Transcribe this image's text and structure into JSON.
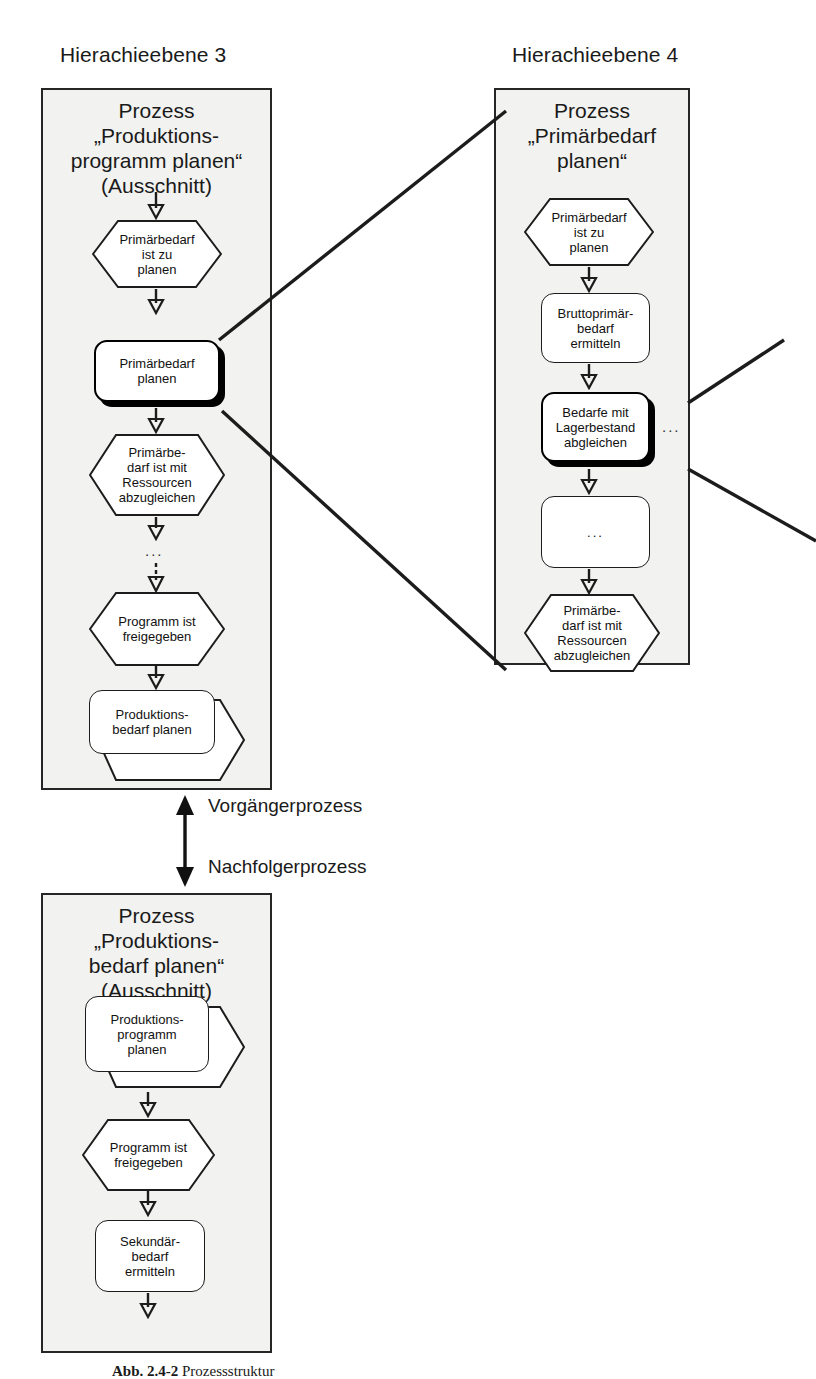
{
  "figure": {
    "caption_label": "Abb. 2.4-2",
    "caption_text": "Prozessstruktur"
  },
  "levels": [
    {
      "id": "level3",
      "label": "Hierachieebene 3"
    },
    {
      "id": "level4",
      "label": "Hierachieebene 4"
    }
  ],
  "boxes": {
    "left": {
      "title": "Prozess\n„Produktions-\nprogramm planen“\n(Ausschnitt)",
      "nodes": [
        {
          "id": "l-ev1",
          "type": "event",
          "text": "Primärbedarf\nist zu\nplanen"
        },
        {
          "id": "l-fn1",
          "type": "function",
          "text": "Primärbedarf\nplanen",
          "highlighted": true
        },
        {
          "id": "l-ev2",
          "type": "event",
          "text": "Primärbe-\ndarf ist mit\nRessourcen\nabzugleichen"
        },
        {
          "id": "l-gap",
          "type": "ellipsis",
          "text": "..."
        },
        {
          "id": "l-ev3",
          "type": "event",
          "text": "Programm ist\nfreigegeben"
        },
        {
          "id": "l-if1",
          "type": "interface",
          "text": "Produktions-\nbedarf planen"
        }
      ]
    },
    "right": {
      "title": "Prozess\n„Primärbedarf\nplanen“",
      "nodes": [
        {
          "id": "r-ev1",
          "type": "event",
          "text": "Primärbedarf\nist zu\nplanen"
        },
        {
          "id": "r-fn1",
          "type": "function",
          "text": "Bruttoprimär-\nbedarf\nermitteln"
        },
        {
          "id": "r-fn2",
          "type": "function",
          "text": "Bedarfe mit\nLagerbestand\nabgleichen",
          "highlighted": true
        },
        {
          "id": "r-fn3",
          "type": "function",
          "text": "..."
        },
        {
          "id": "r-ev2",
          "type": "event",
          "text": "Primärbe-\ndarf ist mit\nRessourcen\nabzugleichen"
        }
      ],
      "side_ellipsis": "..."
    },
    "bottom": {
      "title": "Prozess\n„Produktions-\nbedarf planen“\n(Ausschnitt)",
      "nodes": [
        {
          "id": "b-if1",
          "type": "interface",
          "text": "Produktions-\nprogramm\nplanen"
        },
        {
          "id": "b-ev1",
          "type": "event",
          "text": "Programm ist\nfreigegeben"
        },
        {
          "id": "b-fn1",
          "type": "function",
          "text": "Sekundär-\nbedarf\nermitteln"
        }
      ]
    }
  },
  "relations": {
    "predecessor_label": "Vorgängerprozess",
    "successor_label": "Nachfolgerprozess"
  },
  "colors": {
    "stroke": "#1c1c1c",
    "box_fill": "#f2f2f0",
    "node_fill": "#ffffff",
    "highlight": "#000000"
  }
}
